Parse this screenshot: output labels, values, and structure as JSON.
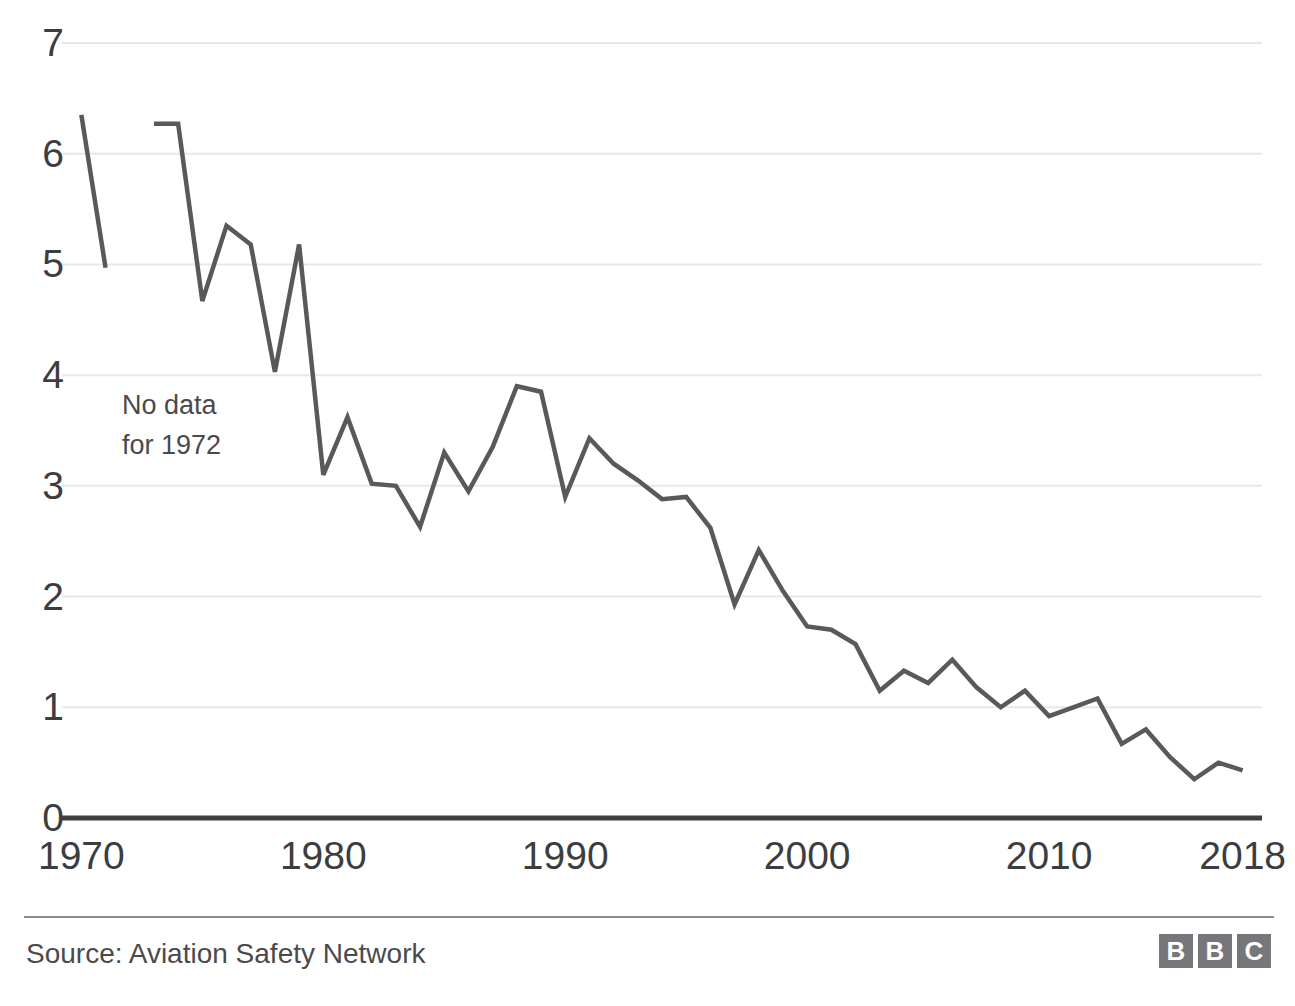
{
  "chart_data": {
    "type": "line",
    "title": "",
    "subtitle": "",
    "xlabel": "",
    "ylabel": "",
    "xlim": [
      1969.2,
      2018.8
    ],
    "ylim": [
      0,
      7
    ],
    "grid": true,
    "legend": null,
    "y_ticks": [
      "7",
      "6",
      "5",
      "4",
      "3",
      "2",
      "1",
      "0"
    ],
    "y_tick_values": [
      7,
      6,
      5,
      4,
      3,
      2,
      1,
      0
    ],
    "x_ticks": [
      "1970",
      "1980",
      "1990",
      "2000",
      "2010",
      "2018"
    ],
    "x_tick_values": [
      1970,
      1980,
      1990,
      2000,
      2010,
      2018
    ],
    "line_color": "#58595b",
    "gridline_color": "#e8e8e8",
    "axis_color": "#3f3f42",
    "annotations": [
      {
        "text": "No data\nfor 1972",
        "x": 1970.2,
        "y": 3.7
      }
    ],
    "series": [
      {
        "name": "Fatal accidents per million flights",
        "x": [
          1970,
          1971,
          1972,
          1973,
          1974,
          1975,
          1976,
          1977,
          1978,
          1979,
          1980,
          1981,
          1982,
          1983,
          1984,
          1985,
          1986,
          1987,
          1988,
          1989,
          1990,
          1991,
          1992,
          1993,
          1994,
          1995,
          1996,
          1997,
          1998,
          1999,
          2000,
          2001,
          2002,
          2003,
          2004,
          2005,
          2006,
          2007,
          2008,
          2009,
          2010,
          2011,
          2012,
          2013,
          2014,
          2015,
          2016,
          2017,
          2018
        ],
        "values": [
          6.35,
          4.97,
          null,
          6.27,
          6.27,
          4.67,
          5.35,
          5.18,
          4.03,
          5.18,
          3.1,
          3.62,
          3.02,
          3.0,
          2.63,
          3.3,
          2.95,
          3.35,
          3.9,
          3.85,
          2.9,
          3.43,
          3.2,
          3.05,
          2.88,
          2.9,
          2.62,
          1.93,
          2.42,
          2.05,
          1.73,
          1.7,
          1.57,
          1.15,
          1.33,
          1.22,
          1.43,
          1.18,
          1.0,
          1.15,
          0.92,
          1.0,
          1.08,
          0.67,
          0.8,
          0.55,
          0.35,
          0.5,
          0.43
        ]
      }
    ]
  },
  "annotation": {
    "line1": "No data",
    "line2": "for 1972"
  },
  "footer": {
    "source": "Source: Aviation Safety Network",
    "logo_letters": [
      "B",
      "B",
      "C"
    ]
  }
}
